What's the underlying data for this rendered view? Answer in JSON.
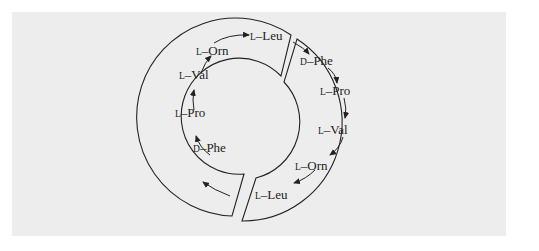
{
  "diagram": {
    "type": "cyclic peptide structure (antiparallel chains)",
    "left_chain": {
      "direction": "bottom-to-top",
      "residues": [
        {
          "config": "D",
          "name": "Phe"
        },
        {
          "config": "L",
          "name": "Pro"
        },
        {
          "config": "L",
          "name": "Val"
        },
        {
          "config": "L",
          "name": "Orn"
        },
        {
          "config": "L",
          "name": "Leu"
        }
      ]
    },
    "right_chain": {
      "direction": "top-to-bottom",
      "residues": [
        {
          "config": "D",
          "name": "Phe"
        },
        {
          "config": "L",
          "name": "Pro"
        },
        {
          "config": "L",
          "name": "Val"
        },
        {
          "config": "L",
          "name": "Orn"
        },
        {
          "config": "L",
          "name": "Leu"
        }
      ]
    },
    "separator": "–",
    "colors": {
      "background": "#ededed",
      "stroke": "#222222",
      "text": "#222222"
    }
  }
}
